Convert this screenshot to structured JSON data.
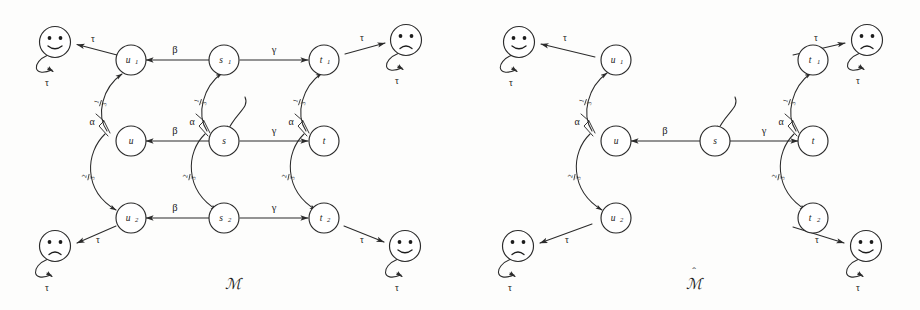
{
  "figure": {
    "panels": [
      {
        "id": "M",
        "caption": "ℳ",
        "caption_hat": "",
        "nodes": [
          {
            "id": "u1",
            "base": "u",
            "sub": "1"
          },
          {
            "id": "s1",
            "base": "s",
            "sub": "1"
          },
          {
            "id": "t1",
            "base": "t",
            "sub": "1"
          },
          {
            "id": "u",
            "base": "u",
            "sub": ""
          },
          {
            "id": "s",
            "base": "s",
            "sub": ""
          },
          {
            "id": "t",
            "base": "t",
            "sub": ""
          },
          {
            "id": "u2",
            "base": "u",
            "sub": "2"
          },
          {
            "id": "s2",
            "base": "s",
            "sub": "2"
          },
          {
            "id": "t2",
            "base": "t",
            "sub": "2"
          }
        ],
        "faces": [
          {
            "id": "face-top-left",
            "expression": "happy",
            "loop_label": "τ",
            "edge_label": "τ",
            "from": "u1"
          },
          {
            "id": "face-top-right",
            "expression": "sad",
            "loop_label": "τ",
            "edge_label": "τ",
            "from": "t1"
          },
          {
            "id": "face-bottom-left",
            "expression": "sad",
            "loop_label": "τ",
            "edge_label": "τ",
            "from": "u2"
          },
          {
            "id": "face-bottom-right",
            "expression": "happy",
            "loop_label": "τ",
            "edge_label": "τ",
            "from": "t2"
          }
        ],
        "action_edges": [
          {
            "from": "s1",
            "to": "u1",
            "label": "β"
          },
          {
            "from": "s1",
            "to": "t1",
            "label": "γ"
          },
          {
            "from": "s",
            "to": "u",
            "label": "β"
          },
          {
            "from": "s",
            "to": "t",
            "label": "γ"
          },
          {
            "from": "s2",
            "to": "u2",
            "label": "β"
          },
          {
            "from": "s2",
            "to": "t2",
            "label": "γ"
          }
        ],
        "prob_edges": [
          {
            "from": "u",
            "to": "u1",
            "action": "α",
            "num": "1",
            "den": "3"
          },
          {
            "from": "u",
            "to": "u2",
            "action": "α",
            "num": "2",
            "den": "3"
          },
          {
            "from": "s",
            "to": "s1",
            "action": "α",
            "num": "1",
            "den": "3"
          },
          {
            "from": "s",
            "to": "s2",
            "action": "α",
            "num": "2",
            "den": "3"
          },
          {
            "from": "t",
            "to": "t1",
            "action": "α",
            "num": "1",
            "den": "3"
          },
          {
            "from": "t",
            "to": "t2",
            "action": "α",
            "num": "2",
            "den": "3"
          }
        ],
        "initial_state": "s"
      },
      {
        "id": "Mhat",
        "caption": "ℳ",
        "caption_hat": "ˆ",
        "nodes": [
          {
            "id": "u1",
            "base": "u",
            "sub": "1"
          },
          {
            "id": "t1",
            "base": "t",
            "sub": "1"
          },
          {
            "id": "u",
            "base": "u",
            "sub": ""
          },
          {
            "id": "s",
            "base": "s",
            "sub": ""
          },
          {
            "id": "t",
            "base": "t",
            "sub": ""
          },
          {
            "id": "u2",
            "base": "u",
            "sub": "2"
          },
          {
            "id": "t2",
            "base": "t",
            "sub": "2"
          }
        ],
        "faces": [
          {
            "id": "face-top-left",
            "expression": "happy",
            "loop_label": "τ",
            "edge_label": "τ",
            "from": "u1"
          },
          {
            "id": "face-top-right",
            "expression": "sad",
            "loop_label": "τ",
            "edge_label": "τ",
            "from": "t1"
          },
          {
            "id": "face-bottom-left",
            "expression": "sad",
            "loop_label": "τ",
            "edge_label": "τ",
            "from": "u2"
          },
          {
            "id": "face-bottom-right",
            "expression": "happy",
            "loop_label": "τ",
            "edge_label": "τ",
            "from": "t2"
          }
        ],
        "action_edges": [
          {
            "from": "s",
            "to": "u",
            "label": "β"
          },
          {
            "from": "s",
            "to": "t",
            "label": "γ"
          }
        ],
        "prob_edges": [
          {
            "from": "u",
            "to": "u1",
            "action": "α",
            "num": "1",
            "den": "3"
          },
          {
            "from": "u",
            "to": "u2",
            "action": "α",
            "num": "2",
            "den": "3"
          },
          {
            "from": "t",
            "to": "t1",
            "action": "α",
            "num": "1",
            "den": "3"
          },
          {
            "from": "t",
            "to": "t2",
            "action": "α",
            "num": "2",
            "den": "3"
          }
        ],
        "initial_state": "s"
      }
    ],
    "colors": {
      "ink": "#2b2b2b",
      "paper": "#fdfdfc",
      "text": "#1b1b1b"
    }
  }
}
